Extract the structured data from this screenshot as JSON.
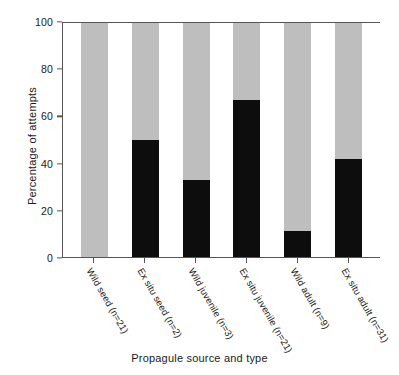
{
  "chart_data": {
    "type": "bar",
    "stacked": true,
    "title": "",
    "xlabel": "Propagule source and type",
    "ylabel": "Percentage of attempts",
    "ylim": [
      0,
      100
    ],
    "yticks": [
      0,
      20,
      40,
      60,
      80,
      100
    ],
    "grid": false,
    "legend": "none",
    "categories": [
      "Wild seed (n=21)",
      "Ex situ seed (n=2)",
      "Wild juvenile (n=3)",
      "Ex situ juvenile (n=21)",
      "Wild adult (n=9)",
      "Ex situ adult (n=31)"
    ],
    "series": [
      {
        "name": "black-segment",
        "color": "#0d0d0d",
        "position": "bottom",
        "values": [
          0,
          50,
          33,
          67,
          11,
          42
        ]
      },
      {
        "name": "gray-segment",
        "color": "#bebebe",
        "position": "top",
        "values": [
          100,
          50,
          67,
          33,
          89,
          58
        ]
      }
    ],
    "sample_sizes": [
      21,
      2,
      3,
      21,
      9,
      31
    ]
  },
  "axes": {
    "y_title": "Percentage of attempts",
    "x_title": "Propagule source and type",
    "y_tick_labels": [
      "100",
      "80",
      "60",
      "40",
      "20",
      "0"
    ]
  },
  "colors": {
    "bar_black": "#0d0d0d",
    "bar_gray": "#bebebe",
    "axis": "#555555",
    "background": "#ffffff",
    "text": "#1a1a1a"
  }
}
